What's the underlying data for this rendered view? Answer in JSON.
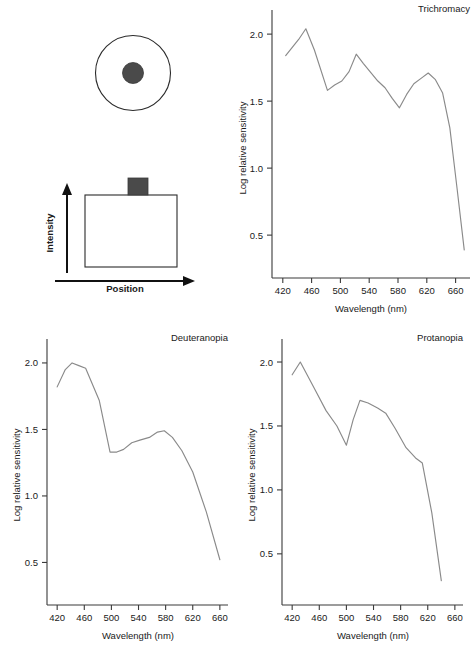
{
  "figure": {
    "background": "#ffffff",
    "line_color": "#8a8a8a",
    "axis_color": "#3a3a3a",
    "dark_fill": "#4a4a4a"
  },
  "stimulus_diagram": {
    "name": "spot-on-disk-stimulus",
    "outer_shape": "circle-outline",
    "inner_shape": "filled-dot"
  },
  "intensity_profile_diagram": {
    "y_axis_label": "Intensity",
    "x_axis_label": "Position",
    "profile_shape": "rectangle-with-bump",
    "bump_fill": "#4a4a4a"
  },
  "chart_data": [
    {
      "type": "line",
      "title": "Trichromacy",
      "xlabel": "Wavelength (nm)",
      "ylabel": "Log relative sensitivity",
      "xlim": [
        405,
        680
      ],
      "ylim": [
        0.18,
        2.18
      ],
      "xticks": [
        420,
        460,
        500,
        540,
        580,
        620,
        660
      ],
      "yticks": [
        0.5,
        1.0,
        1.5,
        2.0
      ],
      "grid": false,
      "legend": "none",
      "x": [
        424,
        442,
        452,
        464,
        482,
        492,
        502,
        512,
        522,
        532,
        552,
        562,
        572,
        582,
        592,
        602,
        612,
        622,
        632,
        642,
        652,
        662,
        672
      ],
      "values": [
        1.84,
        1.96,
        2.04,
        1.88,
        1.58,
        1.62,
        1.65,
        1.72,
        1.85,
        1.78,
        1.65,
        1.6,
        1.52,
        1.45,
        1.55,
        1.63,
        1.67,
        1.71,
        1.66,
        1.56,
        1.3,
        0.85,
        0.39
      ]
    },
    {
      "type": "line",
      "title": "Deuteranopia",
      "xlabel": "Wavelength (nm)",
      "ylabel": "Log relative sensitivity",
      "xlim": [
        405,
        672
      ],
      "ylim": [
        0.18,
        2.18
      ],
      "xticks": [
        420,
        460,
        500,
        540,
        580,
        620,
        660
      ],
      "yticks": [
        0.5,
        1.0,
        1.5,
        2.0
      ],
      "grid": false,
      "legend": "none",
      "x": [
        420,
        432,
        442,
        452,
        462,
        482,
        498,
        508,
        518,
        530,
        542,
        556,
        568,
        578,
        590,
        604,
        620,
        640,
        660
      ],
      "values": [
        1.82,
        1.95,
        2.0,
        1.98,
        1.96,
        1.72,
        1.33,
        1.33,
        1.35,
        1.4,
        1.42,
        1.44,
        1.48,
        1.49,
        1.44,
        1.34,
        1.18,
        0.88,
        0.52
      ]
    },
    {
      "type": "line",
      "title": "Protanopia",
      "xlabel": "Wavelength (nm)",
      "ylabel": "Log relative sensitivity",
      "xlim": [
        405,
        672
      ],
      "ylim": [
        0.1,
        2.18
      ],
      "xticks": [
        420,
        460,
        500,
        540,
        580,
        620,
        660
      ],
      "yticks": [
        0.5,
        1.0,
        1.5,
        2.0
      ],
      "grid": false,
      "legend": "none",
      "x": [
        420,
        432,
        452,
        470,
        486,
        500,
        510,
        520,
        532,
        546,
        558,
        572,
        588,
        602,
        612,
        626,
        640
      ],
      "values": [
        1.9,
        2.0,
        1.8,
        1.62,
        1.5,
        1.35,
        1.55,
        1.7,
        1.68,
        1.64,
        1.6,
        1.48,
        1.33,
        1.25,
        1.21,
        0.82,
        0.29
      ]
    }
  ]
}
